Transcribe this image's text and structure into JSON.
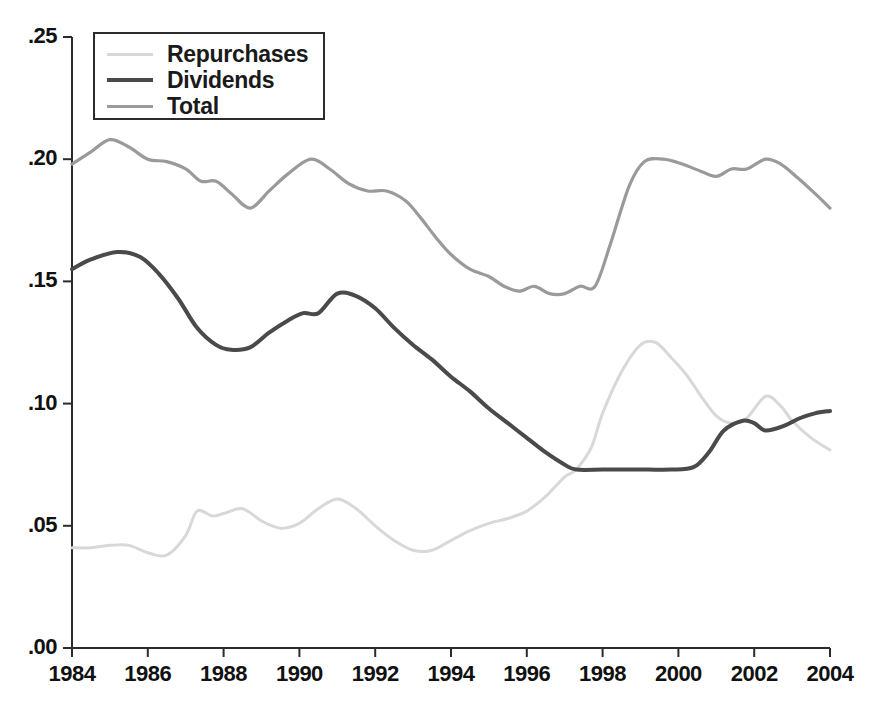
{
  "chart_data": {
    "type": "line",
    "title": "",
    "subtitle": "",
    "xlabel": "",
    "ylabel": "",
    "xlim": [
      1984,
      2004
    ],
    "ylim": [
      0.0,
      0.25
    ],
    "grid": false,
    "legend_position": "top-left",
    "x_ticks": [
      "1984",
      "1986",
      "1988",
      "1990",
      "1992",
      "1994",
      "1996",
      "1998",
      "2000",
      "2002",
      "2004"
    ],
    "x_tick_values": [
      1984,
      1986,
      1988,
      1990,
      1992,
      1994,
      1996,
      1998,
      2000,
      2002,
      2004
    ],
    "y_ticks": [
      ".00",
      ".05",
      ".10",
      ".15",
      ".20",
      ".25"
    ],
    "y_tick_values": [
      0.0,
      0.05,
      0.1,
      0.15,
      0.2,
      0.25
    ],
    "series": [
      {
        "name": "Repurchases",
        "color": "#d8d8d8",
        "width": 3.0,
        "x": [
          1984.0,
          1984.5,
          1985.0,
          1985.5,
          1986.0,
          1986.5,
          1987.0,
          1987.3,
          1987.7,
          1988.0,
          1988.5,
          1989.0,
          1989.5,
          1990.0,
          1990.5,
          1991.0,
          1991.5,
          1992.0,
          1992.5,
          1993.0,
          1993.5,
          1994.0,
          1994.5,
          1995.0,
          1995.5,
          1996.0,
          1996.5,
          1997.0,
          1997.3,
          1997.7,
          1998.0,
          1998.5,
          1999.0,
          1999.4,
          1999.8,
          2000.2,
          2000.6,
          2001.0,
          2001.4,
          2001.8,
          2002.3,
          2002.7,
          2003.0,
          2003.5,
          2004.0
        ],
        "y": [
          0.041,
          0.041,
          0.042,
          0.042,
          0.039,
          0.038,
          0.046,
          0.056,
          0.054,
          0.055,
          0.057,
          0.052,
          0.049,
          0.051,
          0.057,
          0.061,
          0.057,
          0.05,
          0.044,
          0.04,
          0.04,
          0.044,
          0.048,
          0.051,
          0.053,
          0.056,
          0.062,
          0.07,
          0.073,
          0.082,
          0.096,
          0.113,
          0.124,
          0.125,
          0.119,
          0.112,
          0.103,
          0.095,
          0.092,
          0.094,
          0.103,
          0.099,
          0.093,
          0.086,
          0.081
        ]
      },
      {
        "name": "Dividends",
        "color": "#4a4a4a",
        "width": 4.0,
        "x": [
          1984.0,
          1984.5,
          1985.2,
          1985.8,
          1986.3,
          1986.8,
          1987.3,
          1987.8,
          1988.2,
          1988.7,
          1989.2,
          1989.7,
          1990.1,
          1990.5,
          1991.0,
          1991.5,
          1992.0,
          1992.5,
          1993.0,
          1993.5,
          1994.0,
          1994.5,
          1995.0,
          1995.5,
          1996.0,
          1996.5,
          1997.0,
          1997.3,
          1998.0,
          1998.6,
          1999.2,
          1999.8,
          2000.4,
          2000.8,
          2001.2,
          2001.7,
          2002.0,
          2002.3,
          2002.8,
          2003.2,
          2003.6,
          2004.0
        ],
        "y": [
          0.155,
          0.159,
          0.162,
          0.16,
          0.153,
          0.143,
          0.131,
          0.124,
          0.122,
          0.123,
          0.129,
          0.134,
          0.137,
          0.137,
          0.145,
          0.144,
          0.139,
          0.131,
          0.124,
          0.118,
          0.111,
          0.105,
          0.098,
          0.092,
          0.086,
          0.08,
          0.075,
          0.073,
          0.073,
          0.073,
          0.073,
          0.073,
          0.074,
          0.08,
          0.089,
          0.093,
          0.092,
          0.089,
          0.091,
          0.094,
          0.096,
          0.097
        ]
      },
      {
        "name": "Total",
        "color": "#9a9a9a",
        "width": 3.2,
        "x": [
          1984.0,
          1984.5,
          1985.0,
          1985.5,
          1986.0,
          1986.5,
          1987.0,
          1987.4,
          1987.8,
          1988.2,
          1988.7,
          1989.2,
          1989.7,
          1990.3,
          1990.8,
          1991.3,
          1991.8,
          1992.3,
          1992.8,
          1993.2,
          1993.6,
          1994.0,
          1994.5,
          1995.0,
          1995.4,
          1995.8,
          1996.2,
          1996.6,
          1997.0,
          1997.4,
          1997.8,
          1998.2,
          1998.7,
          1999.1,
          1999.6,
          2000.1,
          2000.6,
          2001.0,
          2001.4,
          2001.8,
          2002.3,
          2002.7,
          2003.1,
          2003.6,
          2004.0
        ],
        "y": [
          0.198,
          0.203,
          0.208,
          0.205,
          0.2,
          0.199,
          0.196,
          0.191,
          0.191,
          0.186,
          0.18,
          0.187,
          0.194,
          0.2,
          0.196,
          0.19,
          0.187,
          0.187,
          0.183,
          0.176,
          0.168,
          0.161,
          0.155,
          0.152,
          0.148,
          0.146,
          0.148,
          0.145,
          0.145,
          0.148,
          0.148,
          0.165,
          0.189,
          0.199,
          0.2,
          0.198,
          0.195,
          0.193,
          0.196,
          0.196,
          0.2,
          0.198,
          0.193,
          0.186,
          0.18
        ]
      }
    ],
    "axis_color": "#2b2b2b"
  },
  "legend": {
    "entries": [
      {
        "label": "Repurchases"
      },
      {
        "label": "Dividends"
      },
      {
        "label": "Total"
      }
    ]
  }
}
